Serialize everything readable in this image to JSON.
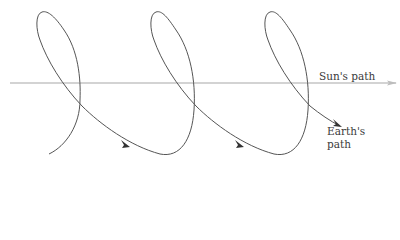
{
  "labels": {
    "sun_path": "Sun's path",
    "earth_path_line1": "Earth's",
    "earth_path_line2": "path"
  },
  "colors": {
    "sun_path_line": "#c4c4c4",
    "earth_path_curve": "#555555",
    "text": "#3a3a3a",
    "background": "#ffffff"
  },
  "geometry": {
    "sun_line_y": 83,
    "loop_count": 3,
    "loop_period_px": 114
  }
}
